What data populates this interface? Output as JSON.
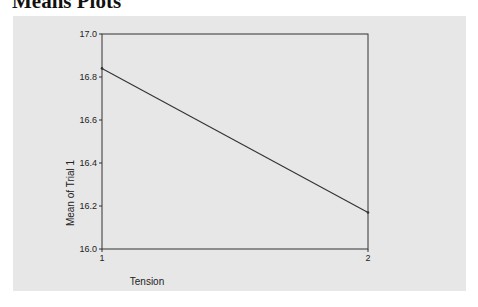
{
  "page": {
    "title": "Means Plots"
  },
  "chart_data": {
    "type": "line",
    "title": "Means Plots",
    "xlabel": "Tension",
    "ylabel": "Mean of Trial 1",
    "categories": [
      "1",
      "2"
    ],
    "x": [
      1,
      2
    ],
    "series": [
      {
        "name": "Mean of Trial 1",
        "values": [
          16.84,
          16.17
        ]
      }
    ],
    "ylim": [
      16.0,
      17.0
    ],
    "yticks": [
      "16.0",
      "16.2",
      "16.4",
      "16.6",
      "16.8",
      "17.0"
    ],
    "xticks": [
      "1",
      "2"
    ],
    "grid": false,
    "legend": null,
    "colors": {
      "panel": "#e7e7e7",
      "line": "#333333",
      "frame": "#333333"
    }
  }
}
